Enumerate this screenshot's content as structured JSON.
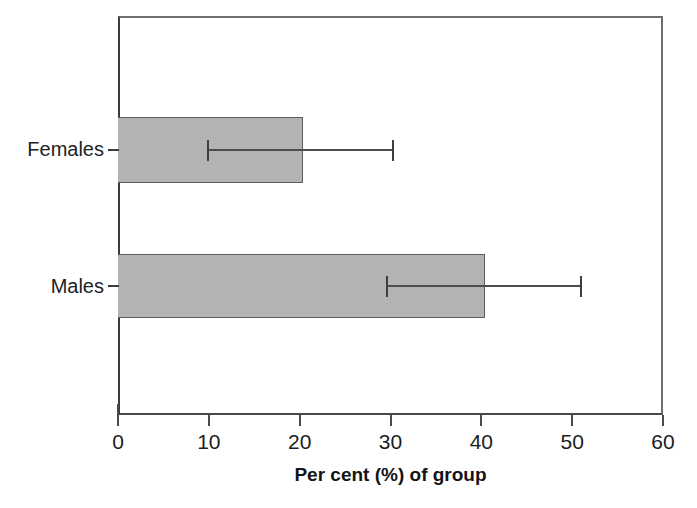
{
  "chart_data": {
    "type": "bar",
    "orientation": "horizontal",
    "title": "",
    "subtitle": "",
    "xlabel": "Per cent (%) of group",
    "ylabel": "",
    "categories": [
      "Females",
      "Males"
    ],
    "values": [
      20.4,
      40.4
    ],
    "error_bars": {
      "type": "confidence-interval",
      "lower": [
        9.8,
        29.5
      ],
      "upper": [
        30.2,
        50.9
      ]
    },
    "series": [
      {
        "name": "Per cent (%) of group",
        "values": [
          20.4,
          40.4
        ],
        "ci_lower": [
          9.8,
          29.5
        ],
        "ci_upper": [
          30.2,
          50.9
        ],
        "color": "#b3b3b3"
      }
    ],
    "xlim": [
      0,
      60
    ],
    "xticks": [
      0,
      10,
      20,
      30,
      40,
      50,
      60
    ],
    "xticklabels": [
      "0",
      "10",
      "20",
      "30",
      "40",
      "50",
      "60"
    ],
    "ylim_categories": [
      "Females",
      "Males"
    ],
    "grid": false,
    "legend": null,
    "legend_position": "none",
    "annotations": [],
    "colors": {
      "bar_fill": "#b3b3b3",
      "bar_edge": "#5c5c5c",
      "axis": "#4a4a4a",
      "error_bar": "#4d4d4d",
      "text": "#1a1a1a",
      "background": "#ffffff"
    }
  }
}
